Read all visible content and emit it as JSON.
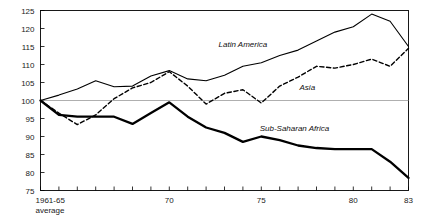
{
  "chart_data": {
    "type": "line",
    "title": "",
    "subtitle": "",
    "xlabel": "",
    "ylabel": "",
    "xlim": [
      1963,
      1983
    ],
    "ylim": [
      75,
      125
    ],
    "grid": false,
    "legend_position": "inline-annotations",
    "reference_line": 100,
    "y_ticks": [
      75,
      80,
      85,
      90,
      95,
      100,
      105,
      110,
      115,
      120,
      125
    ],
    "y_tick_labels": [
      "75",
      "80",
      "85",
      "90",
      "95",
      "100",
      "105",
      "110",
      "115",
      "120",
      "125"
    ],
    "x_base_label_line1": "1961-65",
    "x_base_label_line2": "average",
    "x_ticks": [
      1963,
      1964,
      1965,
      1966,
      1967,
      1968,
      1969,
      1970,
      1971,
      1972,
      1973,
      1974,
      1975,
      1976,
      1977,
      1978,
      1979,
      1980,
      1981,
      1982,
      1983
    ],
    "x_tick_labels": [
      "",
      "",
      "",
      "",
      "",
      "",
      "",
      "70",
      "",
      "",
      "",
      "",
      "75",
      "",
      "",
      "",
      "",
      "80",
      "",
      "",
      "83"
    ],
    "x_labeled_ticks": [
      {
        "x": 1970,
        "label": "70"
      },
      {
        "x": 1975,
        "label": "75"
      },
      {
        "x": 1980,
        "label": "80"
      },
      {
        "x": 1983,
        "label": "83"
      }
    ],
    "x": [
      1963,
      1964,
      1965,
      1966,
      1967,
      1968,
      1969,
      1970,
      1971,
      1972,
      1973,
      1974,
      1975,
      1976,
      1977,
      1978,
      1979,
      1980,
      1981,
      1982,
      1983
    ],
    "series": [
      {
        "name": "Latin America",
        "style": "solid-thin",
        "label": "Latin America",
        "values": [
          100.0,
          101.5,
          103.2,
          105.5,
          103.8,
          104.0,
          106.8,
          108.3,
          106.0,
          105.5,
          107.0,
          109.5,
          110.5,
          112.5,
          114.0,
          116.5,
          119.0,
          120.5,
          124.0,
          122.0,
          115.0
        ]
      },
      {
        "name": "Asia",
        "style": "dashed",
        "label": "Asia",
        "values": [
          100.0,
          96.5,
          93.3,
          96.0,
          100.5,
          103.5,
          105.0,
          108.0,
          104.0,
          99.0,
          102.0,
          103.0,
          99.3,
          104.0,
          106.5,
          109.5,
          109.0,
          110.0,
          111.5,
          109.5,
          114.5
        ]
      },
      {
        "name": "Sub-Saharan Africa",
        "style": "solid-thick",
        "label": "Sub-Saharan Africa",
        "values": [
          100.0,
          96.0,
          95.5,
          95.5,
          95.5,
          93.5,
          96.5,
          99.5,
          95.5,
          92.5,
          91.0,
          88.5,
          90.0,
          89.0,
          87.5,
          86.8,
          86.5,
          86.5,
          86.5,
          83.0,
          78.5
        ]
      }
    ],
    "annotations": [
      {
        "text": "Latin America",
        "x": 1974.0,
        "y": 115.0
      },
      {
        "text": "Asia",
        "x": 1977.5,
        "y": 103.0
      },
      {
        "text": "Sub-Saharan Africa",
        "x": 1976.8,
        "y": 91.5
      }
    ]
  }
}
